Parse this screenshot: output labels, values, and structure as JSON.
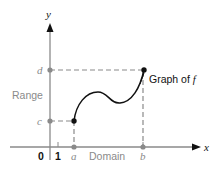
{
  "figure": {
    "axis_labels": {
      "x": "x",
      "y": "y"
    },
    "y_ticks": {
      "d": "d",
      "c": "c"
    },
    "x_ticks": {
      "zero": "0",
      "one": "1",
      "a": "a",
      "b": "b"
    },
    "region_labels": {
      "range": "Range",
      "domain": "Domain"
    },
    "curve_label": "Graph of ",
    "curve_label_fn": "f",
    "colors": {
      "axis": "#8a8a8a",
      "curve": "#111111",
      "dashed": "#8a8a8a",
      "gray_text": "#8a8a8a",
      "black_text": "#111111"
    }
  }
}
